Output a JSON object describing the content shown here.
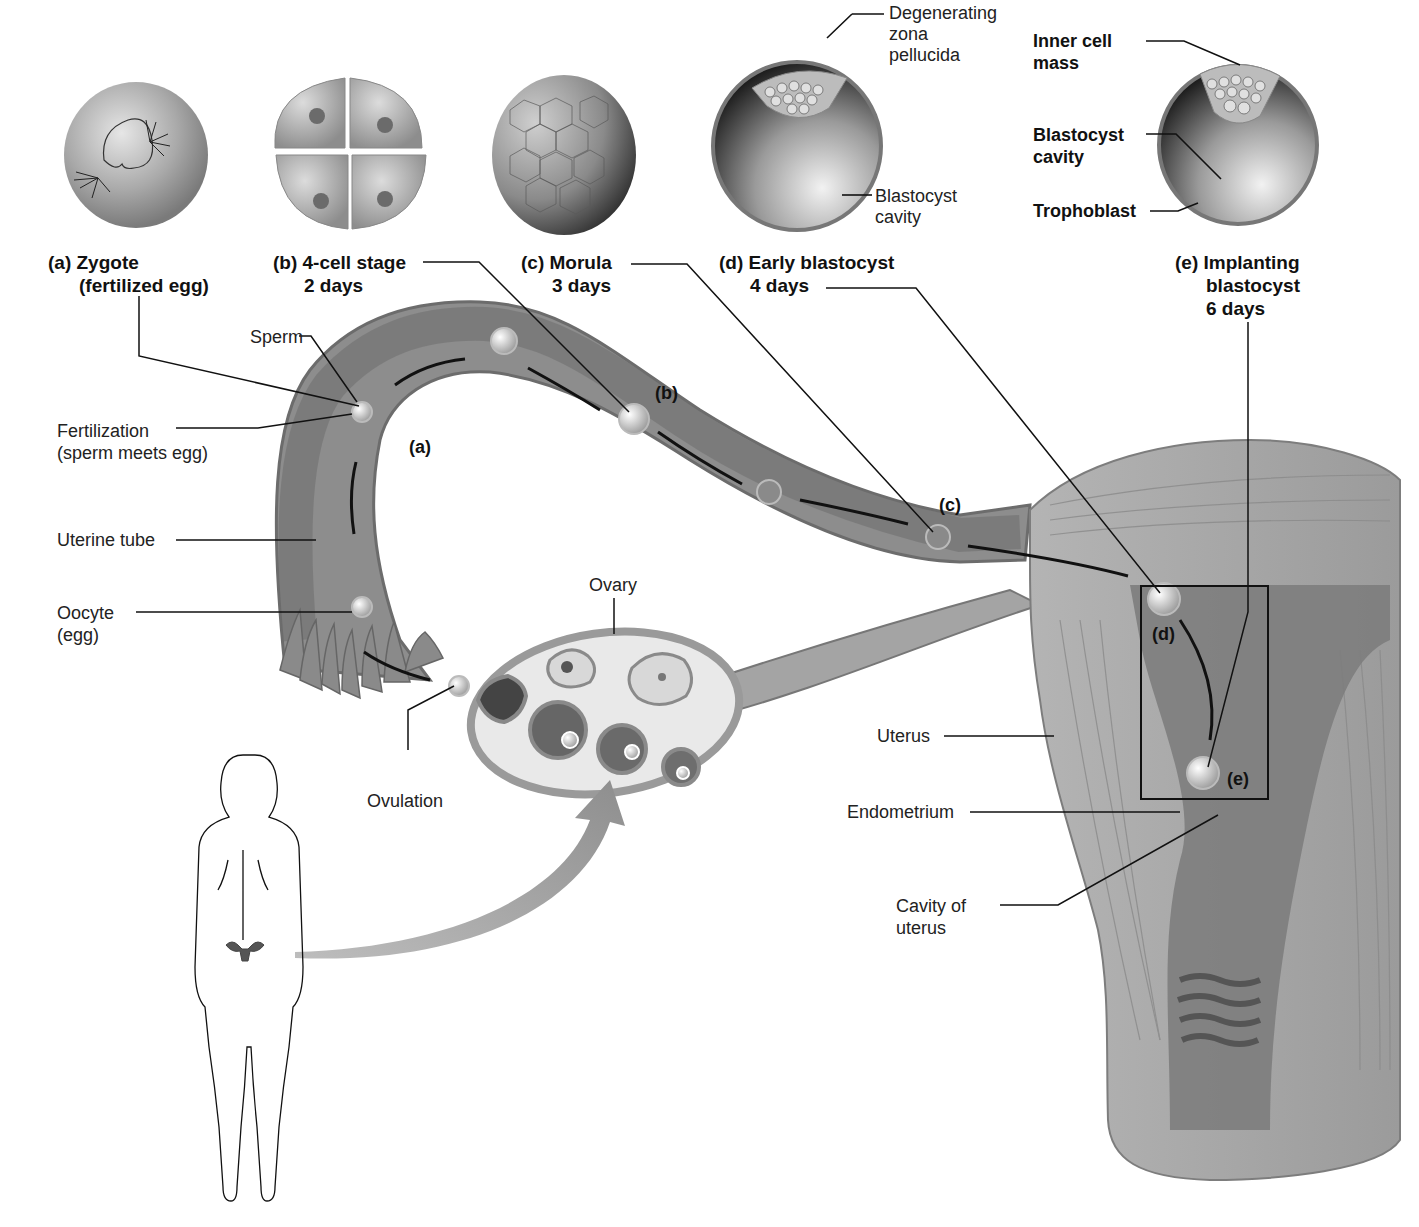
{
  "stages": [
    {
      "letter": "(a)",
      "name": "Zygote",
      "sub": "(fertilized egg)"
    },
    {
      "letter": "(b)",
      "name": "4-cell stage",
      "sub": "2 days"
    },
    {
      "letter": "(c)",
      "name": "Morula",
      "sub": "3 days"
    },
    {
      "letter": "(d)",
      "name": "Early blastocyst",
      "sub": "4 days"
    },
    {
      "letter": "(e)",
      "name": "Implanting",
      "sub": "blastocyst",
      "sub2": "6 days"
    }
  ],
  "early_blastocyst_labels": {
    "zona_1": "Degenerating",
    "zona_2": "zona",
    "zona_3": "pellucida",
    "cavity_1": "Blastocyst",
    "cavity_2": "cavity"
  },
  "implanting_labels": {
    "inner_1": "Inner cell",
    "inner_2": "mass",
    "cavity_1": "Blastocyst",
    "cavity_2": "cavity",
    "trophoblast": "Trophoblast"
  },
  "anatomy_labels": {
    "sperm": "Sperm",
    "fertilization_1": "Fertilization",
    "fertilization_2": "(sperm meets egg)",
    "uterine_tube": "Uterine tube",
    "oocyte_1": "Oocyte",
    "oocyte_2": "(egg)",
    "ovary": "Ovary",
    "ovulation": "Ovulation",
    "uterus": "Uterus",
    "endometrium": "Endometrium",
    "cavity_1": "Cavity of",
    "cavity_2": "uterus"
  },
  "path_tags": {
    "a": "(a)",
    "b": "(b)",
    "c": "(c)",
    "d": "(d)",
    "e": "(e)"
  },
  "colors": {
    "tissue": "#8c8c8c",
    "tissue_light": "#bdbdbd",
    "lumen": "#6f6f6f",
    "line": "#111111"
  }
}
